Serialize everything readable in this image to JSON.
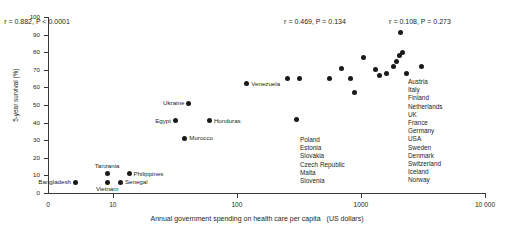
{
  "chart_data": {
    "type": "scatter",
    "title": "",
    "xlabel": "Annual government spending on health care per capita",
    "xunits": "(US dollars)",
    "ylabel": "5-year survival (%)",
    "xscale": "log",
    "xlim": [
      3,
      10000
    ],
    "ylim": [
      0,
      100
    ],
    "grid": false,
    "legend": "none",
    "origin_label": "0",
    "xticks": [
      {
        "value": 10,
        "label": "10"
      },
      {
        "value": 100,
        "label": "100"
      },
      {
        "value": 1000,
        "label": "1000"
      },
      {
        "value": 10000,
        "label": "10 000"
      }
    ],
    "yticks": [
      {
        "value": 0,
        "label": "0"
      },
      {
        "value": 10,
        "label": "10"
      },
      {
        "value": 20,
        "label": "20"
      },
      {
        "value": 30,
        "label": "30"
      },
      {
        "value": 40,
        "label": "40"
      },
      {
        "value": 50,
        "label": "50"
      },
      {
        "value": 60,
        "label": "60"
      },
      {
        "value": 70,
        "label": "70"
      },
      {
        "value": 80,
        "label": "80"
      },
      {
        "value": 90,
        "label": "90"
      },
      {
        "value": 100,
        "label": "100"
      }
    ],
    "points": [
      {
        "label": "Bangladesh",
        "x": 5.0,
        "y": 6,
        "pos": "left"
      },
      {
        "label": "Vietnam",
        "x": 9.0,
        "y": 6,
        "pos": "below"
      },
      {
        "label": "Senegal",
        "x": 11.5,
        "y": 6,
        "pos": "right"
      },
      {
        "label": "Tanzania",
        "x": 9.0,
        "y": 11,
        "pos": "above"
      },
      {
        "label": "Philippines",
        "x": 13.5,
        "y": 11,
        "pos": "right"
      },
      {
        "label": "Morocco",
        "x": 38,
        "y": 31,
        "pos": "right"
      },
      {
        "label": "Egypt",
        "x": 32,
        "y": 41,
        "pos": "left"
      },
      {
        "label": "Honduras",
        "x": 60,
        "y": 41,
        "pos": "right"
      },
      {
        "label": "Ukraine",
        "x": 41,
        "y": 51,
        "pos": "left"
      },
      {
        "label": "Venezuela",
        "x": 120,
        "y": 62,
        "pos": "right"
      },
      {
        "label": "",
        "x": 255,
        "y": 65,
        "pos": "none"
      },
      {
        "label": "",
        "x": 320,
        "y": 65,
        "pos": "none"
      },
      {
        "label": "",
        "x": 300,
        "y": 42,
        "pos": "none"
      },
      {
        "label": "",
        "x": 560,
        "y": 65,
        "pos": "none"
      },
      {
        "label": "",
        "x": 700,
        "y": 71,
        "pos": "none"
      },
      {
        "label": "",
        "x": 830,
        "y": 65,
        "pos": "none"
      },
      {
        "label": "",
        "x": 890,
        "y": 57,
        "pos": "none"
      },
      {
        "label": "",
        "x": 1050,
        "y": 77,
        "pos": "none"
      },
      {
        "label": "",
        "x": 1300,
        "y": 70,
        "pos": "none"
      },
      {
        "label": "",
        "x": 1420,
        "y": 67,
        "pos": "none"
      },
      {
        "label": "",
        "x": 1600,
        "y": 68,
        "pos": "none"
      },
      {
        "label": "",
        "x": 1820,
        "y": 72,
        "pos": "none"
      },
      {
        "label": "",
        "x": 1950,
        "y": 75,
        "pos": "none"
      },
      {
        "label": "",
        "x": 2050,
        "y": 78,
        "pos": "none"
      },
      {
        "label": "",
        "x": 2150,
        "y": 80,
        "pos": "none"
      },
      {
        "label": "",
        "x": 2100,
        "y": 91,
        "pos": "none"
      },
      {
        "label": "",
        "x": 2350,
        "y": 68,
        "pos": "none"
      },
      {
        "label": "",
        "x": 3050,
        "y": 72,
        "pos": "none"
      }
    ],
    "annotations": [
      {
        "id": "stat-low",
        "r": "0.882",
        "p": "< 0.0001",
        "x": 37,
        "y": 18,
        "text": "r  = 0.882, P < 0.0001"
      },
      {
        "id": "stat-mid",
        "r": "0.469",
        "p": "= 0.134",
        "x": 315,
        "y": 18,
        "text": "r = 0.469, P = 0.134"
      },
      {
        "id": "stat-high",
        "r": "0.108",
        "p": "= 0.273",
        "x": 420,
        "y": 18,
        "text": "r  = 0.108, P = 0.273"
      }
    ],
    "country_lists": [
      {
        "id": "middle-countries",
        "x": 300,
        "y": 136,
        "items": [
          "Poland",
          "Estonia",
          "Slovakia",
          "Czech Republic",
          "Malta",
          "Slovenia"
        ]
      },
      {
        "id": "high-income-countries",
        "x": 408,
        "y": 78,
        "items": [
          "Austria",
          "Italy",
          "Finland",
          "Netherlands",
          "UK",
          "France",
          "Germany",
          "USA",
          "Sweden",
          "Denmark",
          "Switzerland",
          "Iceland",
          "Norway"
        ]
      }
    ],
    "colors": {
      "point": "#1a1a1a",
      "axis": "#3a3a3a",
      "text": "#231f20",
      "background": "#ffffff"
    }
  }
}
